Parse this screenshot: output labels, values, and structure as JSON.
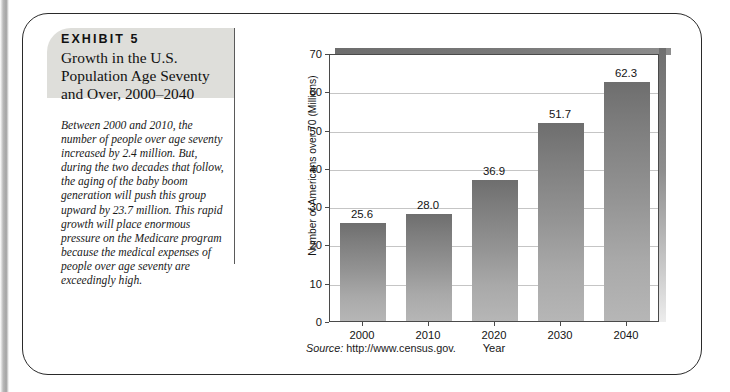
{
  "exhibit": {
    "kicker": "EXHIBIT 5",
    "title": "Growth in the U.S. Population Age Seventy and Over, 2000–2040",
    "caption": "Between 2000 and 2010, the number of people over age seventy increased by 2.4 million. But, during the two decades that follow, the aging of the baby boom generation will push this group upward by 23.7 million. This rapid growth will place enormous pressure on the Medicare program because the medical expenses of people over age seventy are exceedingly high.",
    "source_label": "Source:",
    "source_url": "http://www.census.gov."
  },
  "chart_data": {
    "type": "bar",
    "title": "",
    "categories": [
      "2000",
      "2010",
      "2020",
      "2030",
      "2040"
    ],
    "values": [
      25.6,
      28.0,
      36.9,
      51.7,
      62.3
    ],
    "value_labels": [
      "25.6",
      "28.0",
      "36.9",
      "51.7",
      "62.3"
    ],
    "xlabel": "Year",
    "ylabel": "Number of Americans over 70 (Millions)",
    "ylim": [
      0,
      70
    ],
    "yticks": [
      0,
      10,
      20,
      30,
      40,
      50,
      60,
      70
    ],
    "ytick_labels": [
      "0",
      "10",
      "20",
      "30",
      "40",
      "50",
      "60",
      "70"
    ],
    "grid": true,
    "legend": "none",
    "bar_color_top": "#6e6e6e",
    "bar_color_bottom": "#b6b6b6"
  },
  "colors": {
    "header_band": "#dededa",
    "card_border": "#2a2a2a",
    "gridline": "#c5c5c5",
    "axis": "#4a4a4a"
  }
}
